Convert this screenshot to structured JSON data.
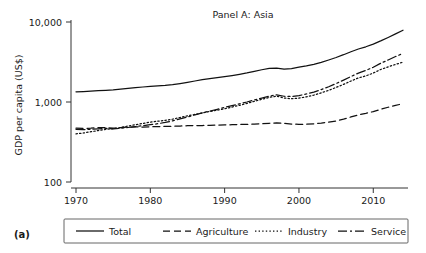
{
  "figure": {
    "panel_letter": "(a)"
  },
  "chart_data": {
    "type": "line",
    "title": "Panel A: Asia",
    "xlabel": "",
    "ylabel": "GDP per capita (US$)",
    "yscale": "log",
    "ylim": [
      100,
      10000
    ],
    "xlim": [
      1970,
      2014
    ],
    "grid": false,
    "legend_position": "bottom",
    "ytick_labels": [
      "100",
      "1,000",
      "10,000"
    ],
    "ytick_values": [
      100,
      1000,
      10000
    ],
    "xtick_labels": [
      "1970",
      "1980",
      "1990",
      "2000",
      "2010"
    ],
    "xtick_values": [
      1970,
      1980,
      1990,
      2000,
      2010
    ],
    "x": [
      1970,
      1971,
      1972,
      1973,
      1974,
      1975,
      1976,
      1977,
      1978,
      1979,
      1980,
      1981,
      1982,
      1983,
      1984,
      1985,
      1986,
      1987,
      1988,
      1989,
      1990,
      1991,
      1992,
      1993,
      1994,
      1995,
      1996,
      1997,
      1998,
      1999,
      2000,
      2001,
      2002,
      2003,
      2004,
      2005,
      2006,
      2007,
      2008,
      2009,
      2010,
      2011,
      2012,
      2013,
      2014
    ],
    "series": [
      {
        "name": "Total",
        "style": "solid",
        "values": [
          1340,
          1350,
          1365,
          1385,
          1400,
          1420,
          1450,
          1480,
          1510,
          1540,
          1570,
          1590,
          1610,
          1650,
          1700,
          1760,
          1830,
          1900,
          1960,
          2010,
          2070,
          2140,
          2220,
          2310,
          2420,
          2530,
          2640,
          2660,
          2580,
          2620,
          2720,
          2830,
          2960,
          3130,
          3350,
          3600,
          3900,
          4250,
          4600,
          4900,
          5300,
          5800,
          6400,
          7100,
          7900
        ]
      },
      {
        "name": "Agriculture",
        "style": "dashed",
        "values": [
          470,
          468,
          470,
          478,
          480,
          470,
          478,
          485,
          488,
          485,
          490,
          492,
          495,
          498,
          500,
          505,
          508,
          508,
          512,
          515,
          518,
          520,
          523,
          526,
          530,
          536,
          542,
          548,
          540,
          530,
          525,
          528,
          533,
          545,
          560,
          580,
          610,
          650,
          690,
          720,
          760,
          810,
          860,
          910,
          950
        ]
      },
      {
        "name": "Industry",
        "style": "dotted",
        "values": [
          400,
          410,
          425,
          440,
          455,
          465,
          480,
          500,
          520,
          540,
          560,
          575,
          590,
          610,
          640,
          670,
          700,
          730,
          760,
          790,
          825,
          865,
          910,
          960,
          1020,
          1080,
          1140,
          1185,
          1120,
          1100,
          1120,
          1160,
          1220,
          1300,
          1400,
          1520,
          1660,
          1830,
          2000,
          2120,
          2300,
          2550,
          2750,
          2950,
          3150
        ]
      },
      {
        "name": "Service",
        "style": "dashdot",
        "values": [
          455,
          452,
          455,
          462,
          468,
          462,
          470,
          480,
          492,
          505,
          520,
          535,
          555,
          580,
          615,
          650,
          690,
          730,
          770,
          810,
          855,
          900,
          950,
          1000,
          1060,
          1120,
          1185,
          1230,
          1180,
          1170,
          1200,
          1260,
          1330,
          1430,
          1550,
          1700,
          1880,
          2080,
          2300,
          2480,
          2720,
          3050,
          3350,
          3700,
          4050
        ]
      }
    ]
  },
  "legend": {
    "items": [
      {
        "label": "Total",
        "style": "solid"
      },
      {
        "label": "Agriculture",
        "style": "dashed"
      },
      {
        "label": "Industry",
        "style": "dotted"
      },
      {
        "label": "Service",
        "style": "dashdot"
      }
    ]
  }
}
